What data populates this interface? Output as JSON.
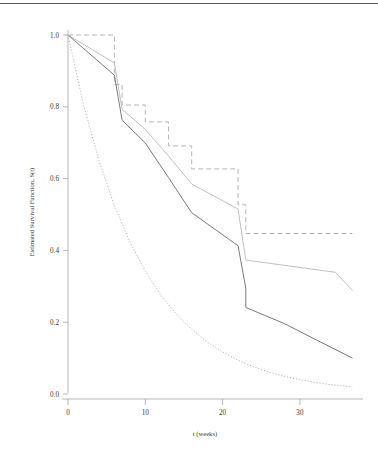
{
  "chart_data": {
    "type": "line",
    "title": "",
    "xlabel": "t (weeks)",
    "ylabel": "Estimated Survival Function, S(t)",
    "xlim": [
      -1.6,
      37.5
    ],
    "ylim": [
      -0.045,
      1.045
    ],
    "xticks": [
      0,
      10,
      20,
      30
    ],
    "xticklabels": [
      "0",
      "10",
      "20",
      "30"
    ],
    "yticks": [
      0.0,
      0.2,
      0.4,
      0.6,
      0.8,
      1.0
    ],
    "yticklabels": [
      "0.0",
      "0.2",
      "0.4",
      "0.6",
      "0.8",
      "1.0"
    ],
    "grid": false,
    "legend": "none",
    "colors": {
      "kaplan_meier_dashed": "#aeaeae",
      "kaplan_meier_gray": "#b9b9b9",
      "cox_solid_dark": "#6b6b6b",
      "exponential_dotted": "#b2b2b2"
    },
    "series": [
      {
        "name": "Kaplan-Meier step (upper, dashed)",
        "style": "dashed-step",
        "color": "#aeaeae",
        "x": [
          0,
          6,
          6,
          7,
          7,
          10,
          10,
          13,
          13,
          16,
          16,
          22,
          22,
          23,
          23,
          36.8
        ],
        "y": [
          1.0,
          1.0,
          0.862,
          0.862,
          0.805,
          0.805,
          0.758,
          0.758,
          0.691,
          0.691,
          0.627,
          0.627,
          0.527,
          0.527,
          0.447,
          0.447
        ]
      },
      {
        "name": "Kaplan-Meier step (middle, light gray)",
        "style": "solid-step",
        "color": "#b9b9b9",
        "x": [
          0,
          6,
          6,
          7,
          7,
          10,
          10,
          13,
          13,
          16,
          16,
          22,
          22,
          23,
          23,
          34.6,
          36.8
        ],
        "y": [
          1.0,
          0.922,
          0.922,
          0.793,
          0.793,
          0.737,
          0.737,
          0.663,
          0.663,
          0.585,
          0.585,
          0.515,
          0.515,
          0.373,
          0.373,
          0.339,
          0.288
        ]
      },
      {
        "name": "Cox model estimate (solid dark)",
        "style": "solid-step",
        "color": "#6b6b6b",
        "x": [
          0,
          6,
          6,
          7,
          7,
          10,
          10,
          13,
          13,
          16,
          16,
          22,
          22,
          23,
          23,
          28,
          32,
          36.8
        ],
        "y": [
          1.0,
          0.888,
          0.888,
          0.763,
          0.763,
          0.699,
          0.699,
          0.603,
          0.603,
          0.505,
          0.505,
          0.413,
          0.413,
          0.295,
          0.241,
          0.196,
          0.152,
          0.1
        ]
      },
      {
        "name": "Exponential model (dotted)",
        "style": "dotted-smooth",
        "color": "#b2b2b2",
        "x": [
          0,
          2,
          4,
          6,
          8,
          10,
          12,
          14,
          16,
          18,
          20,
          22,
          24,
          26,
          28,
          30,
          32,
          34,
          36.8
        ],
        "y": [
          1.0,
          0.806,
          0.651,
          0.525,
          0.424,
          0.342,
          0.276,
          0.223,
          0.18,
          0.145,
          0.117,
          0.094,
          0.076,
          0.061,
          0.049,
          0.04,
          0.032,
          0.026,
          0.02
        ]
      }
    ]
  },
  "figure": {
    "background_color": "#ffffff",
    "top_rule_color": "#5a5a5a"
  }
}
